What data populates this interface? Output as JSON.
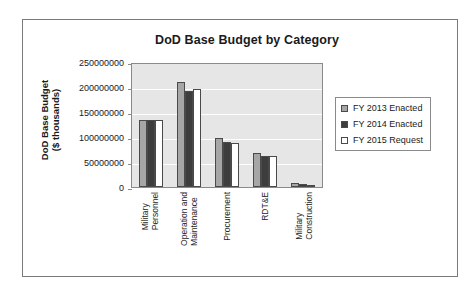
{
  "chart_data": {
    "type": "bar",
    "title": "DoD Base Budget by Category",
    "xlabel": "",
    "ylabel_lines": [
      "DoD Base Budget",
      "($ thousands)"
    ],
    "ylabel": "DoD Base Budget ($ thousands)",
    "ylim": [
      0,
      250000000
    ],
    "ytick_labels": [
      "250000000",
      "200000000",
      "150000000",
      "100000000",
      "50000000",
      "0"
    ],
    "ytick_values": [
      250000000,
      200000000,
      150000000,
      100000000,
      50000000,
      0
    ],
    "grid": true,
    "legend_position": "right",
    "categories": [
      "Military Personnel",
      "Operation and Maintenance",
      "Procurement",
      "RDT&E",
      "Military Construction"
    ],
    "category_lines": [
      [
        "Military",
        "Personnel"
      ],
      [
        "Operation and",
        "Maintenance"
      ],
      [
        "Procurement"
      ],
      [
        "RDT&E"
      ],
      [
        "Military",
        "Construction"
      ]
    ],
    "series": [
      {
        "name": "FY 2013 Enacted",
        "color": "#a6a6a6",
        "values": [
          135000000,
          210000000,
          99000000,
          68000000,
          8000000
        ]
      },
      {
        "name": "FY 2014 Enacted",
        "color": "#3d3d3d",
        "values": [
          135000000,
          192000000,
          91000000,
          62000000,
          6000000
        ]
      },
      {
        "name": "FY 2015 Request",
        "color": "#ffffff",
        "values": [
          135000000,
          197000000,
          88000000,
          62000000,
          4000000
        ]
      }
    ]
  },
  "legend": {
    "items": [
      {
        "label": "FY 2013 Enacted"
      },
      {
        "label": "FY 2014 Enacted"
      },
      {
        "label": "FY 2015 Request"
      }
    ]
  }
}
